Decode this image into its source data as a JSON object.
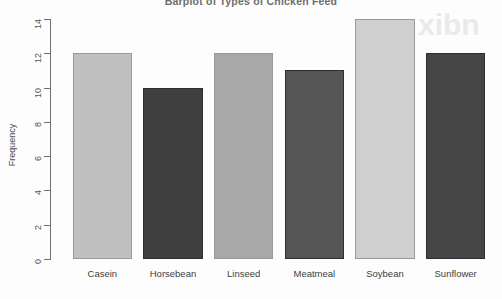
{
  "chart_data": {
    "type": "bar",
    "title": "Barplot of Types of Chicken Feed",
    "xlabel": "",
    "ylabel": "Frequency",
    "categories": [
      "Casein",
      "Horsebean",
      "Linseed",
      "Meatmeal",
      "Soybean",
      "Sunflower"
    ],
    "values": [
      12,
      10,
      12,
      11,
      14,
      12
    ],
    "ylim": [
      0,
      14
    ],
    "yticks": [
      0,
      2,
      4,
      6,
      8,
      10,
      12,
      14
    ],
    "grid": false,
    "legend": null,
    "bar_colors": [
      "#c0c0c0",
      "#3f3f3f",
      "#a8a8a8",
      "#555555",
      "#cfcfcf",
      "#454545"
    ],
    "colors": {
      "light_bar": "#c0c0c0",
      "dark_bar": "#3f3f3f",
      "axis": "#6f6f6f",
      "text": "#3d3d3d",
      "background": "#fdfdfd"
    }
  }
}
